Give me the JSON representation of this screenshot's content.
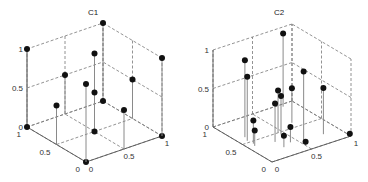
{
  "figure": {
    "width": 368,
    "height": 182,
    "background": "#ffffff"
  },
  "colors": {
    "axis": "#555555",
    "grid": "#777777",
    "stem": "#8a8a8a",
    "marker": "#111111",
    "text": "#333333"
  },
  "chart_data": [
    {
      "type": "scatter3d-stem",
      "title": "C1",
      "xlabel": "",
      "ylabel": "",
      "zlabel": "",
      "xlim": [
        0,
        1
      ],
      "ylim": [
        0,
        1
      ],
      "zlim": [
        0,
        1
      ],
      "x_ticks": [
        "0",
        "0.5",
        "1"
      ],
      "y_ticks": [
        "0",
        "0.5",
        "1"
      ],
      "z_ticks": [
        "0",
        "0.5",
        "1"
      ],
      "grid": "dashed",
      "points": [
        {
          "x": 0,
          "y": 1,
          "z": 1
        },
        {
          "x": 0,
          "y": 1,
          "z": 0
        },
        {
          "x": 1,
          "y": 1,
          "z": 1
        },
        {
          "x": 1,
          "y": 1,
          "z": 0
        },
        {
          "x": 0,
          "y": 0,
          "z": 0
        },
        {
          "x": 1,
          "y": 0,
          "z": 0
        },
        {
          "x": 1,
          "y": 0,
          "z": 1
        },
        {
          "x": 0.5,
          "y": 1,
          "z": 0.5
        },
        {
          "x": 1,
          "y": 0.5,
          "z": 0.5
        },
        {
          "x": 0.5,
          "y": 0.5,
          "z": 1
        },
        {
          "x": 0.5,
          "y": 0.5,
          "z": 0.5
        },
        {
          "x": 0.5,
          "y": 0.5,
          "z": 0
        },
        {
          "x": 0,
          "y": 0,
          "z": 1
        },
        {
          "x": 0,
          "y": 0.5,
          "z": 0.5
        },
        {
          "x": 0.5,
          "y": 0,
          "z": 0.5
        }
      ],
      "projection": {
        "origin": [
          86,
          162
        ],
        "ex": [
          76,
          -26
        ],
        "ey": [
          -59,
          -35
        ],
        "ez": [
          0,
          -78
        ],
        "title_pos": [
          93,
          15
        ]
      }
    },
    {
      "type": "scatter3d-stem",
      "title": "C2",
      "xlabel": "",
      "ylabel": "",
      "zlabel": "",
      "xlim": [
        0,
        1
      ],
      "ylim": [
        0,
        1
      ],
      "zlim": [
        0,
        1
      ],
      "x_ticks": [
        "0",
        "0.5",
        "1"
      ],
      "y_ticks": [
        "0",
        "0.5",
        "1"
      ],
      "z_ticks": [
        "0",
        "0.5",
        "1"
      ],
      "grid": "dashed",
      "points": [
        {
          "x": 0.12,
          "y": 0.62,
          "z": 1.0
        },
        {
          "x": 0.09,
          "y": 0.54,
          "z": 0.83
        },
        {
          "x": 0.85,
          "y": 0.95,
          "z": 0.95
        },
        {
          "x": 0.55,
          "y": 0.2,
          "z": 0.9
        },
        {
          "x": 0.8,
          "y": 0.2,
          "z": 0.6
        },
        {
          "x": 0.45,
          "y": 0.5,
          "z": 0.55
        },
        {
          "x": 0.45,
          "y": 0.45,
          "z": 0.5
        },
        {
          "x": 0.3,
          "y": 0.35,
          "z": 0.5
        },
        {
          "x": 0.7,
          "y": 0.6,
          "z": 0.45
        },
        {
          "x": 0.1,
          "y": 0.45,
          "z": 0.3
        },
        {
          "x": 0.08,
          "y": 0.4,
          "z": 0.2
        },
        {
          "x": 0.3,
          "y": 0.2,
          "z": 0.15
        },
        {
          "x": 0.42,
          "y": 0.25,
          "z": 0.2
        },
        {
          "x": 0.5,
          "y": 0.1,
          "z": 0.05
        },
        {
          "x": 1.0,
          "y": 0.02,
          "z": 0.02
        }
      ],
      "projection": {
        "origin": [
          272,
          162
        ],
        "ex": [
          79,
          -26
        ],
        "ey": [
          -59,
          -35
        ],
        "ez": [
          0,
          -77
        ],
        "title_pos": [
          279,
          15
        ]
      }
    }
  ]
}
